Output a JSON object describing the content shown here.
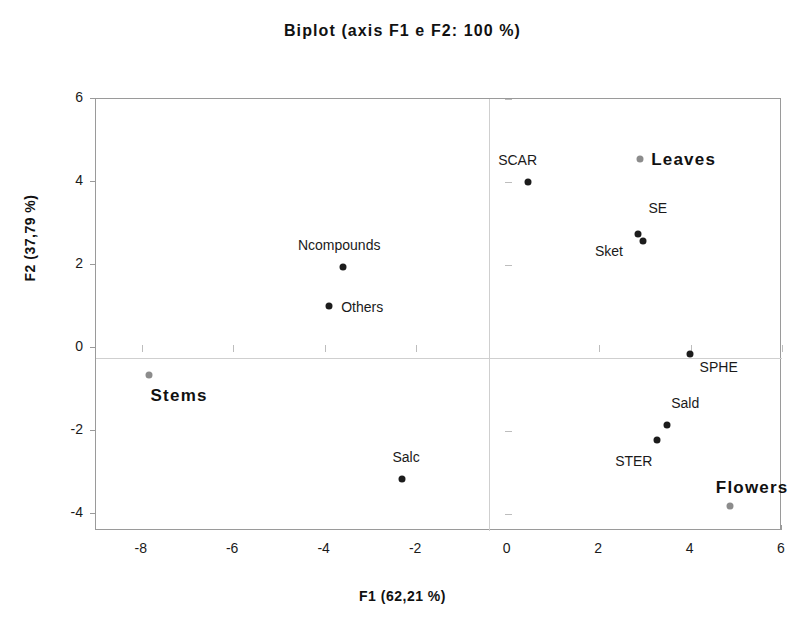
{
  "chart_data": {
    "type": "scatter",
    "title": "Biplot (axis  F1 e F2: 100 %)",
    "xlabel": "F1 (62,21 %)",
    "ylabel": "F2 (37,79 %)",
    "xlim": [
      -9,
      6
    ],
    "ylim": [
      -4.4,
      6
    ],
    "xticks": [
      -8,
      -6,
      -4,
      -2,
      0,
      2,
      4,
      6
    ],
    "yticks": [
      -4,
      -2,
      0,
      2,
      4,
      6
    ],
    "grid": false,
    "legend": "none",
    "series": [
      {
        "name": "variables",
        "color": "#1c1c1c",
        "points": [
          {
            "label": "SCAR",
            "x": 0.45,
            "y": 4.0,
            "label_dx": -30,
            "label_dy": -22
          },
          {
            "label": "SE",
            "x": 2.86,
            "y": 2.75,
            "label_dx": 10,
            "label_dy": -26
          },
          {
            "label": "Sket",
            "x": 2.96,
            "y": 2.57,
            "label_dx": -48,
            "label_dy": 10
          },
          {
            "label": "Ncompounds",
            "x": -3.6,
            "y": 1.96,
            "label_dx": -45,
            "label_dy": -22
          },
          {
            "label": "Others",
            "x": -3.9,
            "y": 1.02,
            "label_dx": 12,
            "label_dy": 1
          },
          {
            "label": "SPHE",
            "x": 3.98,
            "y": -0.14,
            "label_dx": 10,
            "label_dy": 13
          },
          {
            "label": "Sald",
            "x": 3.49,
            "y": -1.85,
            "label_dx": 4,
            "label_dy": -22
          },
          {
            "label": "STER",
            "x": 3.27,
            "y": -2.2,
            "label_dx": -42,
            "label_dy": 21
          },
          {
            "label": "Salc",
            "x": -2.3,
            "y": -3.15,
            "label_dx": -10,
            "label_dy": -22
          }
        ]
      },
      {
        "name": "groups",
        "color": "#8c8c8c",
        "points": [
          {
            "label": "Leaves",
            "x": 2.9,
            "y": 4.55,
            "label_dx": 11,
            "label_dy": -1
          },
          {
            "label": "Stems",
            "x": -7.85,
            "y": -0.65,
            "label_dx": 2,
            "label_dy": 19
          },
          {
            "label": "Flowers",
            "x": 4.86,
            "y": -3.81,
            "label_dx": -14,
            "label_dy": -20
          }
        ]
      }
    ]
  }
}
